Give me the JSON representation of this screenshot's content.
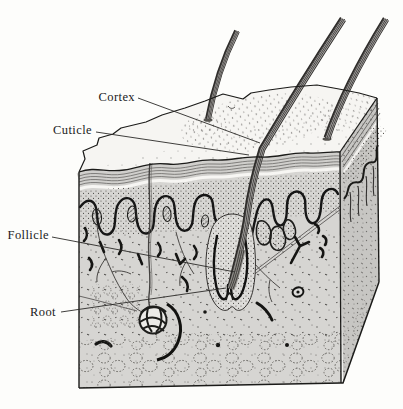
{
  "figure": {
    "labels": {
      "cortex": "Cortex",
      "cuticle": "Cuticle",
      "follicle": "Follicle",
      "root": "Root"
    },
    "colors": {
      "ink": "#1b1b1b",
      "front_face": "#d6d5d2",
      "side_face": "#c7c6c3",
      "top_face": "#f6f5f2",
      "background": "#fdfdfb"
    }
  }
}
